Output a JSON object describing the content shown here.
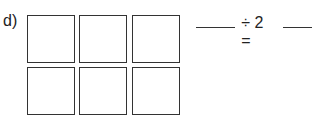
{
  "problem": {
    "label": "d)",
    "grid": {
      "rows": 2,
      "cols": 3
    },
    "equation": {
      "operator_text": "÷ 2 =",
      "blank_1": "",
      "blank_2": ""
    }
  }
}
